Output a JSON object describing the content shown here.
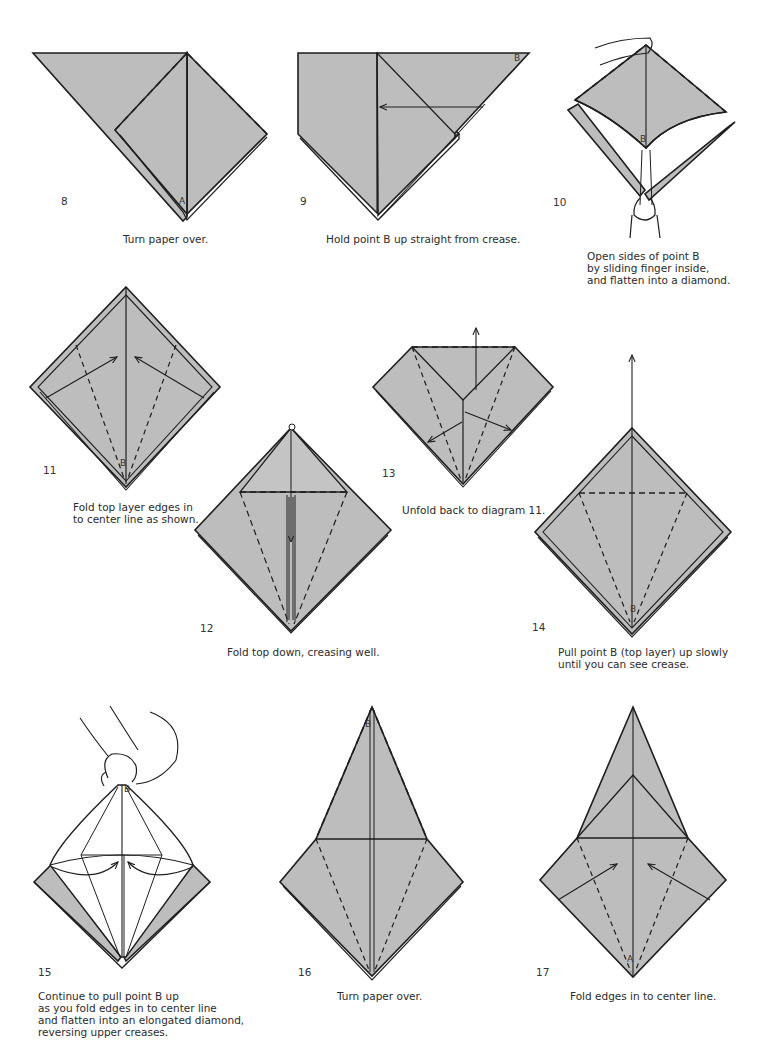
{
  "page": {
    "paper_color": "#bdbdbd",
    "line_color": "#1e1e1e",
    "background": "#ffffff"
  },
  "steps": [
    {
      "number": "8",
      "caption": "Turn paper over.",
      "point_label": "A"
    },
    {
      "number": "9",
      "caption": "Hold point B up straight from crease.",
      "point_label": "B"
    },
    {
      "number": "10",
      "caption": "Open sides of point B\nby sliding finger inside,\nand flatten into a diamond.",
      "point_label": "B"
    },
    {
      "number": "11",
      "caption": "Fold top layer edges in\nto center line as shown.",
      "point_label": "B"
    },
    {
      "number": "12",
      "caption": "Fold top down, creasing well."
    },
    {
      "number": "13",
      "caption": "Unfold back to diagram 11."
    },
    {
      "number": "14",
      "caption": "Pull point B (top layer) up slowly\nuntil you can see crease.",
      "point_label": "B"
    },
    {
      "number": "15",
      "caption": "Continue to pull point B up\nas you fold edges in to center line\nand flatten into an elongated diamond,\nreversing upper creases.",
      "point_label": "B"
    },
    {
      "number": "16",
      "caption": "Turn paper over.",
      "point_label": "B"
    },
    {
      "number": "17",
      "caption": "Fold edges in to center line.",
      "point_label": "A"
    }
  ]
}
